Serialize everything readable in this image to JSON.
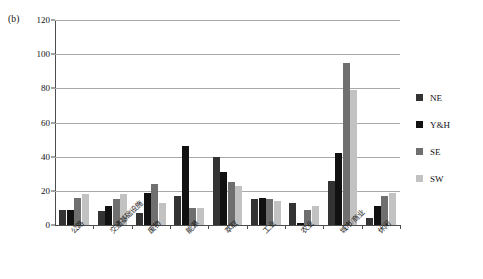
{
  "panel": {
    "tag": "(b)"
  },
  "legend": {
    "position": "right",
    "entries": [
      {
        "label": "NE",
        "color": "#333333"
      },
      {
        "label": "Y&H",
        "color": "#111111"
      },
      {
        "label": "SE",
        "color": "#6f6f6f"
      },
      {
        "label": "SW",
        "color": "#c2c2c2"
      }
    ]
  },
  "chart_data": {
    "type": "bar",
    "title": "",
    "subtitle": "",
    "xlabel": "",
    "ylabel": "",
    "ylim": [
      0,
      120
    ],
    "yticks": [
      0,
      20,
      40,
      60,
      80,
      100,
      120
    ],
    "ytick_labels": [
      "0",
      "20",
      "40",
      "60",
      "80",
      "100",
      "120"
    ],
    "grid": true,
    "grid_axis": "y",
    "legend_position": "right",
    "categories": [
      "公路",
      "交通基础设施",
      "废物",
      "能源",
      "萃取",
      "工业",
      "农业",
      "城市/商业",
      "休闲"
    ],
    "series": [
      {
        "name": "NE",
        "color": "#333333",
        "values": [
          9,
          8,
          7,
          17,
          40,
          15,
          13,
          26,
          4
        ]
      },
      {
        "name": "Y&H",
        "color": "#111111",
        "values": [
          9,
          11,
          19,
          46,
          31,
          16,
          1,
          42,
          11
        ]
      },
      {
        "name": "SE",
        "color": "#6f6f6f",
        "values": [
          16,
          15,
          24,
          10,
          25,
          15,
          9,
          95,
          17
        ]
      },
      {
        "name": "SW",
        "color": "#c2c2c2",
        "values": [
          18,
          18,
          13,
          10,
          23,
          14,
          11,
          79,
          19
        ]
      }
    ]
  }
}
